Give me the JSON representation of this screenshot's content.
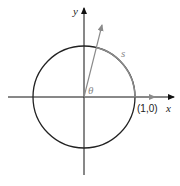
{
  "diagram": {
    "type": "unit-circle",
    "labels": {
      "y_axis": "y",
      "x_axis": "x",
      "arc": "s",
      "angle": "θ",
      "point": "(1,0)"
    },
    "colors": {
      "axis": "#111111",
      "circle": "#222222",
      "highlight": "#8a8a8a"
    }
  }
}
